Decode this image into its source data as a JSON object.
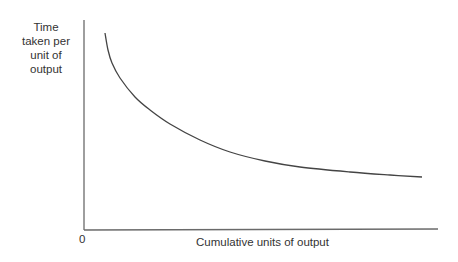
{
  "chart_data": {
    "type": "line",
    "title": "",
    "xlabel": "Cumulative units of output",
    "ylabel": "Time taken per unit of output",
    "ylabel_lines": [
      "Time",
      "taken per",
      "unit of",
      "output"
    ],
    "origin_label": "0",
    "grid": false,
    "legend": null,
    "series": [
      {
        "name": "Learning curve",
        "description": "Decreasing convex curve: time per unit falls steeply at first, then levels off",
        "points_px": [
          [
            105,
            33
          ],
          [
            108,
            50
          ],
          [
            112,
            63
          ],
          [
            120,
            78
          ],
          [
            135,
            97
          ],
          [
            150,
            110
          ],
          [
            170,
            124
          ],
          [
            200,
            140
          ],
          [
            230,
            152
          ],
          [
            265,
            161
          ],
          [
            300,
            167
          ],
          [
            350,
            172
          ],
          [
            390,
            175
          ],
          [
            422,
            177
          ]
        ]
      }
    ],
    "axes_px": {
      "origin": [
        84,
        230
      ],
      "x_end": 438,
      "y_top": 20
    }
  }
}
